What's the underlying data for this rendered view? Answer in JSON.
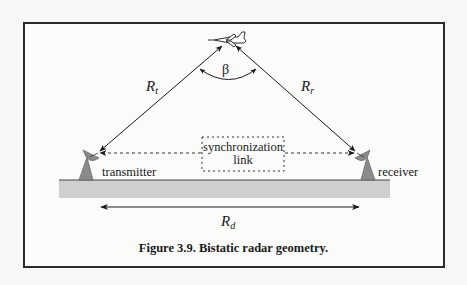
{
  "figure": {
    "caption": "Figure 3.9. Bistatic radar geometry.",
    "labels": {
      "target": "aircraft",
      "transmitter_range": {
        "symbol": "R",
        "subscript": "t"
      },
      "receiver_range": {
        "symbol": "R",
        "subscript": "r"
      },
      "baseline": {
        "symbol": "R",
        "subscript": "d"
      },
      "bistatic_angle": "β",
      "sync_line1": "synchronization",
      "sync_line2": "link",
      "transmitter": "transmitter",
      "receiver": "receiver"
    },
    "colors": {
      "line": "#1a1a1a",
      "ground": "#cfcfcf",
      "antenna": "#8a8a8a",
      "frame": "#2b2b2b"
    }
  }
}
